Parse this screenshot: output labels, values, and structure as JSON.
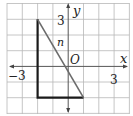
{
  "figure": {
    "type": "coordinate-grid-diagram",
    "grid": {
      "x_min": -4,
      "x_max": 4,
      "y_min": -3,
      "y_max": 4,
      "step": 1
    },
    "axes": {
      "x_label": "x",
      "y_label": "y",
      "origin_label": "O",
      "tick_labels": {
        "x_neg": "−3",
        "x_pos": "3",
        "y_pos": "3"
      }
    },
    "line": {
      "label": "n",
      "from": [
        -2,
        3
      ],
      "to": [
        1,
        -2
      ]
    },
    "triangle": {
      "vertices": [
        [
          -2,
          3
        ],
        [
          -2,
          -2
        ],
        [
          1,
          -2
        ]
      ]
    },
    "colors": {
      "grid": "#b8b8b8",
      "triangle": "#1a1a1a",
      "line_n": "#6b6b6b",
      "axis": "#555555"
    }
  }
}
